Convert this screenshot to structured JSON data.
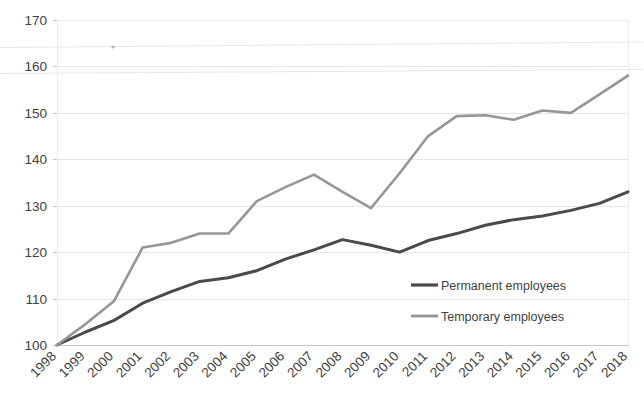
{
  "chart_data": {
    "type": "line",
    "title": "",
    "subtitle": "",
    "xlabel": "",
    "ylabel": "",
    "categories": [
      "1998",
      "1999",
      "2000",
      "2001",
      "2002",
      "2003",
      "2004",
      "2005",
      "2006",
      "2007",
      "2008",
      "2009",
      "2010",
      "2011",
      "2012",
      "2013",
      "2014",
      "2015",
      "2016",
      "2017",
      "2018"
    ],
    "x_tick_labels": [
      "1998",
      "1999",
      "2000",
      "2001",
      "2002",
      "2003",
      "2004",
      "2005",
      "2006",
      "2007",
      "2008",
      "2009",
      "2010",
      "2011",
      "2012",
      "2013",
      "2014",
      "2015",
      "2016",
      "2017",
      "2018"
    ],
    "y_tick_labels": [
      "100",
      "110",
      "120",
      "130",
      "140",
      "150",
      "160",
      "170"
    ],
    "y_ticks": [
      100,
      110,
      120,
      130,
      140,
      150,
      160,
      170
    ],
    "ylim": [
      100,
      170
    ],
    "grid": true,
    "grid_axis": "y",
    "legend_position": "inside lower-right",
    "series": [
      {
        "name": "Permanent employees",
        "color": "#4a4a4a",
        "values": [
          100,
          102.8,
          105.3,
          109,
          111.5,
          113.7,
          114.5,
          116,
          118.5,
          120.5,
          122.7,
          121.5,
          120,
          122.5,
          124,
          125.8,
          127,
          127.8,
          129,
          130.5,
          133
        ]
      },
      {
        "name": "Temporary employees",
        "color": "#969696",
        "values": [
          100,
          104.5,
          109.5,
          121,
          122,
          124,
          124,
          131,
          134,
          136.7,
          133,
          129.5,
          137,
          145,
          149.3,
          149.5,
          148.5,
          150.5,
          150,
          154,
          158
        ]
      }
    ]
  },
  "legend": {
    "items": [
      {
        "label": "Permanent employees",
        "color": "#4a4a4a"
      },
      {
        "label": "Temporary employees",
        "color": "#969696"
      }
    ]
  },
  "axes": {
    "y_axis_name": "value-axis",
    "x_axis_name": "year-axis"
  }
}
